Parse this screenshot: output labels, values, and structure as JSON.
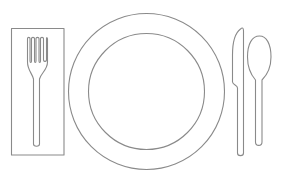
{
  "illustration": {
    "title": "Place setting line drawing",
    "style": "outline",
    "background_color": "#ffffff",
    "stroke_color": "#8a8a8a",
    "elements": [
      {
        "name": "napkin",
        "shape": "rectangle",
        "x": 11,
        "y": 28,
        "width": 53,
        "height": 127
      },
      {
        "name": "fork",
        "tines": 4,
        "position": "on napkin"
      },
      {
        "name": "plate",
        "shape": "concentric circles",
        "center": [
          146.5,
          91.5
        ],
        "outer_radius": 78,
        "inner_radius": 58
      },
      {
        "name": "knife",
        "position": "right of plate"
      },
      {
        "name": "spoon",
        "position": "far right"
      }
    ]
  }
}
